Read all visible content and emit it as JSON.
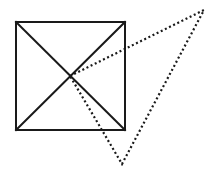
{
  "diagram": {
    "canvas": {
      "width": 221,
      "height": 179,
      "background": "#ffffff"
    },
    "stroke_color": "#1a1a1a",
    "square": {
      "style": "solid",
      "corners": {
        "top_left": [
          16,
          22
        ],
        "top_right": [
          125,
          22
        ],
        "bottom_right": [
          125,
          130
        ],
        "bottom_left": [
          16,
          130
        ]
      },
      "diagonals": [
        {
          "from": [
            16,
            22
          ],
          "to": [
            125,
            130
          ]
        },
        {
          "from": [
            125,
            22
          ],
          "to": [
            16,
            130
          ]
        }
      ],
      "center": [
        70,
        76
      ]
    },
    "triangle": {
      "style": "dotted",
      "vertices": [
        [
          70,
          76
        ],
        [
          204,
          10
        ],
        [
          122,
          164
        ]
      ]
    }
  }
}
